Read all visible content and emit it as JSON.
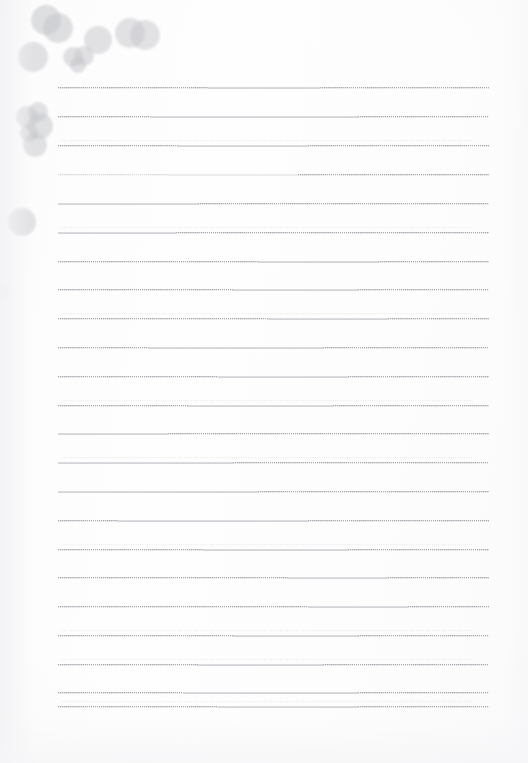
{
  "document": {
    "kind": "scanned-notepad-page",
    "title": "Blank lined notepad page with ink blots",
    "width": 528,
    "height": 763,
    "background_color": "#fdfdfd",
    "paper_tone": "#fcfcfd",
    "orientation": "portrait",
    "text_content": "",
    "has_handwriting": false
  },
  "ruling": {
    "line_count": 23,
    "color": "#8a8c96",
    "faint_color": "#9b9da6",
    "style": "fine-dotted",
    "left_x": 58,
    "right_x": 489,
    "first_line_y": 88,
    "line_spacing": 28.7,
    "lines": [
      {
        "y": 88,
        "left": 58,
        "right": 489,
        "pattern": [
          [
            "dots",
            0,
            150
          ],
          [
            "solid",
            150,
            262
          ],
          [
            "dots",
            262,
            431
          ]
        ],
        "ghost": false
      },
      {
        "y": 117,
        "left": 58,
        "right": 489,
        "pattern": [
          [
            "dots",
            0,
            92
          ],
          [
            "solid",
            92,
            300
          ],
          [
            "dots",
            300,
            431
          ]
        ],
        "ghost": false
      },
      {
        "y": 146,
        "left": 58,
        "right": 489,
        "pattern": [
          [
            "dots",
            0,
            120
          ],
          [
            "solid",
            120,
            250
          ],
          [
            "dots",
            250,
            431
          ]
        ],
        "ghost": true
      },
      {
        "y": 175,
        "left": 58,
        "right": 489,
        "pattern": [
          [
            "dots-faint",
            0,
            110
          ],
          [
            "solid-faint",
            110,
            240
          ],
          [
            "dots",
            240,
            431
          ]
        ],
        "ghost": false
      },
      {
        "y": 204,
        "left": 58,
        "right": 489,
        "pattern": [
          [
            "solid",
            0,
            140
          ],
          [
            "dots",
            140,
            431
          ]
        ],
        "ghost": false
      },
      {
        "y": 233,
        "left": 58,
        "right": 489,
        "pattern": [
          [
            "solid",
            0,
            118
          ],
          [
            "dots",
            118,
            431
          ]
        ],
        "ghost": true
      },
      {
        "y": 262,
        "left": 58,
        "right": 489,
        "pattern": [
          [
            "dots",
            0,
            200
          ],
          [
            "solid",
            200,
            320
          ],
          [
            "dots",
            320,
            431
          ]
        ],
        "ghost": false
      },
      {
        "y": 290,
        "left": 58,
        "right": 489,
        "pattern": [
          [
            "dots",
            0,
            175
          ],
          [
            "solid",
            175,
            300
          ],
          [
            "dots",
            300,
            431
          ]
        ],
        "ghost": false
      },
      {
        "y": 319,
        "left": 58,
        "right": 489,
        "pattern": [
          [
            "dots",
            0,
            210
          ],
          [
            "solid",
            210,
            330
          ],
          [
            "dots",
            330,
            431
          ]
        ],
        "ghost": true
      },
      {
        "y": 348,
        "left": 58,
        "right": 489,
        "pattern": [
          [
            "dots",
            0,
            90
          ],
          [
            "solid",
            90,
            265
          ],
          [
            "dots",
            265,
            431
          ]
        ],
        "ghost": false
      },
      {
        "y": 377,
        "left": 58,
        "right": 489,
        "pattern": [
          [
            "dots",
            0,
            160
          ],
          [
            "solid",
            160,
            290
          ],
          [
            "dots",
            290,
            431
          ]
        ],
        "ghost": false
      },
      {
        "y": 406,
        "left": 58,
        "right": 489,
        "pattern": [
          [
            "dots",
            0,
            130
          ],
          [
            "solid",
            130,
            275
          ],
          [
            "dots",
            275,
            431
          ]
        ],
        "ghost": true
      },
      {
        "y": 434,
        "left": 58,
        "right": 489,
        "pattern": [
          [
            "solid",
            0,
            110
          ],
          [
            "dots",
            110,
            431
          ]
        ],
        "ghost": false
      },
      {
        "y": 463,
        "left": 58,
        "right": 489,
        "pattern": [
          [
            "solid",
            0,
            175
          ],
          [
            "dots",
            175,
            431
          ]
        ],
        "ghost": true
      },
      {
        "y": 492,
        "left": 58,
        "right": 489,
        "pattern": [
          [
            "solid",
            0,
            200
          ],
          [
            "dots",
            200,
            431
          ]
        ],
        "ghost": false
      },
      {
        "y": 521,
        "left": 58,
        "right": 489,
        "pattern": [
          [
            "dots",
            0,
            60
          ],
          [
            "solid",
            60,
            250
          ],
          [
            "dots",
            250,
            431
          ]
        ],
        "ghost": false
      },
      {
        "y": 550,
        "left": 58,
        "right": 489,
        "pattern": [
          [
            "dots",
            0,
            145
          ],
          [
            "solid",
            145,
            290
          ],
          [
            "dots",
            290,
            431
          ]
        ],
        "ghost": true
      },
      {
        "y": 578,
        "left": 58,
        "right": 489,
        "pattern": [
          [
            "dots",
            0,
            230
          ],
          [
            "solid",
            230,
            330
          ],
          [
            "dots",
            330,
            431
          ]
        ],
        "ghost": false
      },
      {
        "y": 607,
        "left": 58,
        "right": 489,
        "pattern": [
          [
            "dots",
            0,
            250
          ],
          [
            "solid",
            250,
            350
          ],
          [
            "dots",
            350,
            431
          ]
        ],
        "ghost": false
      },
      {
        "y": 636,
        "left": 58,
        "right": 489,
        "pattern": [
          [
            "dots",
            0,
            175
          ],
          [
            "solid",
            175,
            300
          ],
          [
            "dots",
            300,
            431
          ]
        ],
        "ghost": true
      },
      {
        "y": 665,
        "left": 58,
        "right": 489,
        "pattern": [
          [
            "dots",
            0,
            140
          ],
          [
            "solid",
            140,
            265
          ],
          [
            "dots",
            265,
            431
          ]
        ],
        "ghost": true
      },
      {
        "y": 693,
        "left": 58,
        "right": 489,
        "pattern": [
          [
            "dots",
            0,
            125
          ],
          [
            "solid",
            125,
            300
          ],
          [
            "dots",
            300,
            431
          ]
        ],
        "ghost": false
      },
      {
        "y": 707,
        "left": 58,
        "right": 489,
        "pattern": [
          [
            "dots",
            0,
            160
          ],
          [
            "solid",
            160,
            300
          ],
          [
            "dots",
            300,
            431
          ]
        ],
        "ghost": true
      }
    ]
  },
  "ink_marks": {
    "color": "#c6c7cb",
    "overlap_color": "#a9aab0",
    "description": "Light grey semi-transparent round ink blots clustered in the upper-left of the page",
    "blot_count": 16,
    "blots": [
      {
        "name": "top-cluster-blot-1",
        "cx": 46,
        "cy": 20,
        "r": 15,
        "opacity": 0.55,
        "blur": "soft"
      },
      {
        "name": "top-cluster-blot-2",
        "cx": 58,
        "cy": 28,
        "r": 15,
        "opacity": 0.55,
        "blur": "soft"
      },
      {
        "name": "top-left-blot",
        "cx": 33,
        "cy": 57,
        "r": 15,
        "opacity": 0.5,
        "blur": "soft"
      },
      {
        "name": "heart-blot-left",
        "cx": 73,
        "cy": 57,
        "r": 10,
        "opacity": 0.52,
        "blur": "soft"
      },
      {
        "name": "heart-blot-right",
        "cx": 84,
        "cy": 56,
        "r": 10,
        "opacity": 0.52,
        "blur": "soft"
      },
      {
        "name": "heart-blot-tail",
        "cx": 78,
        "cy": 65,
        "r": 8,
        "opacity": 0.52,
        "blur": "soft"
      },
      {
        "name": "mid-top-blot",
        "cx": 98,
        "cy": 40,
        "r": 14,
        "opacity": 0.5,
        "blur": "soft"
      },
      {
        "name": "pair-blot-left",
        "cx": 130,
        "cy": 33,
        "r": 15,
        "opacity": 0.5,
        "blur": "soft"
      },
      {
        "name": "pair-blot-right",
        "cx": 145,
        "cy": 35,
        "r": 15,
        "opacity": 0.5,
        "blur": "soft"
      },
      {
        "name": "cluster2-blot-1",
        "cx": 27,
        "cy": 117,
        "r": 11,
        "opacity": 0.5,
        "blur": "soft"
      },
      {
        "name": "cluster2-blot-2",
        "cx": 38,
        "cy": 112,
        "r": 10,
        "opacity": 0.5,
        "blur": "soft"
      },
      {
        "name": "cluster2-blot-3",
        "cx": 40,
        "cy": 126,
        "r": 13,
        "opacity": 0.52,
        "blur": "soft"
      },
      {
        "name": "cluster2-blot-4",
        "cx": 29,
        "cy": 133,
        "r": 9,
        "opacity": 0.5,
        "blur": "soft"
      },
      {
        "name": "cluster2-blot-5",
        "cx": 35,
        "cy": 145,
        "r": 12,
        "opacity": 0.5,
        "blur": "soft"
      },
      {
        "name": "lone-blot",
        "cx": 22,
        "cy": 222,
        "r": 14,
        "opacity": 0.5,
        "blur": "soft"
      },
      {
        "name": "edge-smudge",
        "cx": 3,
        "cy": 291,
        "r": 7,
        "opacity": 0.22,
        "blur": "vsoft"
      }
    ]
  }
}
